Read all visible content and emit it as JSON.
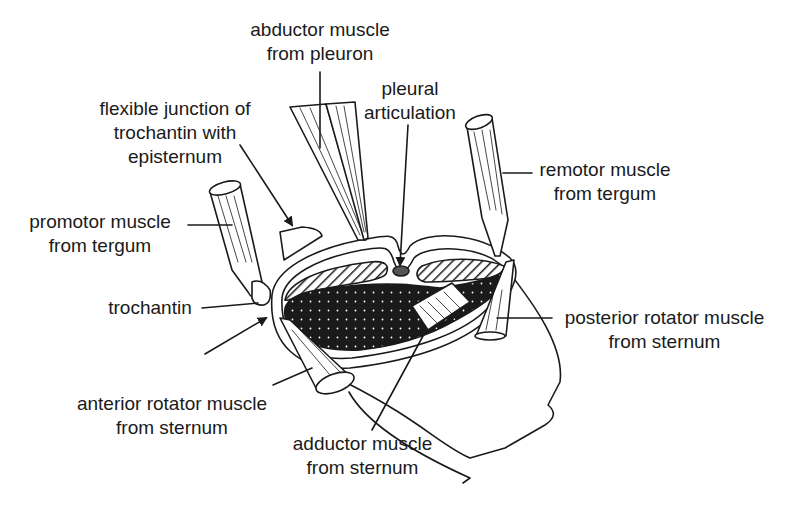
{
  "figure": {
    "background_color": "#ffffff",
    "ink_color": "#1a1a1a",
    "labels": [
      {
        "id": "abductor-pleuron",
        "lines": [
          "abductor muscle",
          "from pleuron"
        ]
      },
      {
        "id": "pleural-articulation",
        "lines": [
          "pleural",
          "articulation"
        ]
      },
      {
        "id": "flexible-junction",
        "lines": [
          "flexible junction of",
          "trochantin with",
          "episternum"
        ]
      },
      {
        "id": "remotor-tergum",
        "lines": [
          "remotor muscle",
          "from tergum"
        ]
      },
      {
        "id": "promotor-tergum",
        "lines": [
          "promotor muscle",
          "from tergum"
        ]
      },
      {
        "id": "trochantin",
        "lines": [
          "trochantin"
        ]
      },
      {
        "id": "posterior-rotator",
        "lines": [
          "posterior rotator muscle",
          "from sternum"
        ]
      },
      {
        "id": "anterior-rotator",
        "lines": [
          "anterior rotator muscle",
          "from sternum"
        ]
      },
      {
        "id": "adductor-sternum",
        "lines": [
          "adductor muscle",
          "from sternum"
        ]
      }
    ]
  }
}
